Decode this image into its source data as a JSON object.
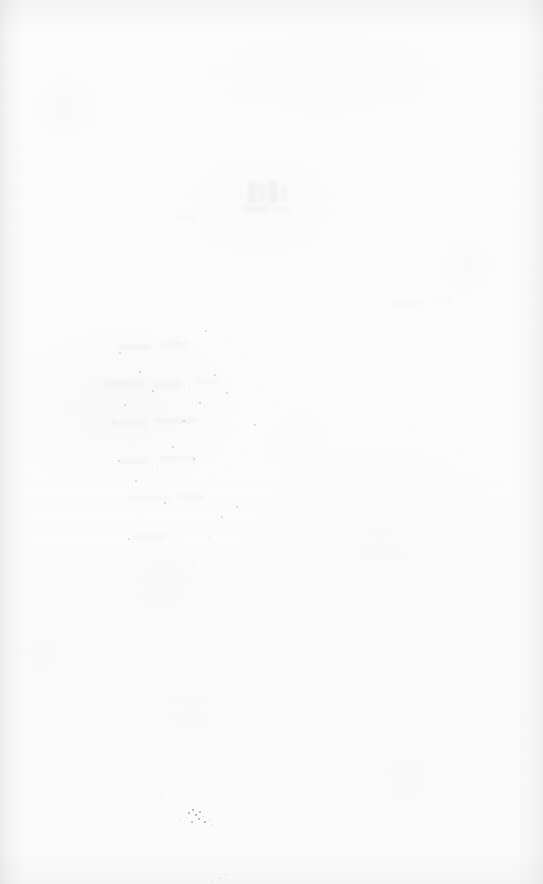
{
  "document": {
    "kind": "scanned-page",
    "content_type": "blank",
    "page_label": "",
    "visible_text": "",
    "width": 543,
    "height": 884
  },
  "appearance": {
    "paper_color": "#fcfcfc",
    "paper_color_light": "#fdfdfd",
    "paper_color_dark": "#fbfbfb",
    "speck_color": "#9a9ca2",
    "speck_color_dark": "#6f7177",
    "edge_shadow_color": "#787c84",
    "ghost_color": "#c9cbd0"
  },
  "regions": {
    "ghost_show_through": {
      "label": "faint show-through near top centre",
      "x": 236,
      "y": 178,
      "width": 62,
      "height": 46
    },
    "speckle_band": {
      "label": "diffuse speckle band, mid page",
      "x": 95,
      "y": 330,
      "width": 195,
      "height": 245
    },
    "dark_speck_cluster": {
      "label": "dark ink fleck cluster near lower left",
      "x": 186,
      "y": 808,
      "width": 28,
      "height": 20
    }
  },
  "ghost_marks": [
    {
      "x": 248,
      "y": 181,
      "w": 9,
      "h": 22,
      "o": 0.16
    },
    {
      "x": 259,
      "y": 184,
      "w": 7,
      "h": 19,
      "o": 0.13
    },
    {
      "x": 268,
      "y": 180,
      "w": 10,
      "h": 23,
      "o": 0.15
    },
    {
      "x": 281,
      "y": 186,
      "w": 6,
      "h": 17,
      "o": 0.11
    },
    {
      "x": 243,
      "y": 205,
      "w": 26,
      "h": 7,
      "o": 0.1
    },
    {
      "x": 272,
      "y": 206,
      "w": 18,
      "h": 6,
      "o": 0.09
    },
    {
      "x": 118,
      "y": 344,
      "w": 34,
      "h": 6,
      "o": 0.1
    },
    {
      "x": 160,
      "y": 341,
      "w": 28,
      "h": 6,
      "o": 0.09
    },
    {
      "x": 104,
      "y": 380,
      "w": 40,
      "h": 7,
      "o": 0.1
    },
    {
      "x": 152,
      "y": 382,
      "w": 30,
      "h": 6,
      "o": 0.09
    },
    {
      "x": 196,
      "y": 378,
      "w": 22,
      "h": 6,
      "o": 0.08
    },
    {
      "x": 110,
      "y": 420,
      "w": 36,
      "h": 6,
      "o": 0.09
    },
    {
      "x": 154,
      "y": 418,
      "w": 44,
      "h": 6,
      "o": 0.09
    },
    {
      "x": 120,
      "y": 458,
      "w": 30,
      "h": 6,
      "o": 0.08
    },
    {
      "x": 158,
      "y": 456,
      "w": 38,
      "h": 6,
      "o": 0.08
    },
    {
      "x": 128,
      "y": 496,
      "w": 42,
      "h": 6,
      "o": 0.08
    },
    {
      "x": 178,
      "y": 494,
      "w": 24,
      "h": 6,
      "o": 0.07
    },
    {
      "x": 132,
      "y": 534,
      "w": 34,
      "h": 6,
      "o": 0.07
    },
    {
      "x": 176,
      "y": 215,
      "w": 20,
      "h": 5,
      "o": 0.07
    },
    {
      "x": 392,
      "y": 300,
      "w": 30,
      "h": 6,
      "o": 0.06
    },
    {
      "x": 430,
      "y": 296,
      "w": 24,
      "h": 6,
      "o": 0.05
    }
  ],
  "specks": [
    {
      "x": 148,
      "y": 332,
      "s": 1.4,
      "o": 0.34
    },
    {
      "x": 176,
      "y": 336,
      "s": 1.1,
      "o": 0.28
    },
    {
      "x": 205,
      "y": 330,
      "s": 1.6,
      "o": 0.38
    },
    {
      "x": 231,
      "y": 341,
      "s": 1.2,
      "o": 0.3
    },
    {
      "x": 119,
      "y": 352,
      "s": 1.5,
      "o": 0.36
    },
    {
      "x": 163,
      "y": 358,
      "s": 1.0,
      "o": 0.26
    },
    {
      "x": 196,
      "y": 351,
      "s": 1.3,
      "o": 0.32
    },
    {
      "x": 246,
      "y": 356,
      "s": 1.1,
      "o": 0.27
    },
    {
      "x": 100,
      "y": 366,
      "s": 1.4,
      "o": 0.33
    },
    {
      "x": 139,
      "y": 371,
      "s": 1.7,
      "o": 0.42
    },
    {
      "x": 182,
      "y": 368,
      "s": 1.2,
      "o": 0.3
    },
    {
      "x": 214,
      "y": 374,
      "s": 1.5,
      "o": 0.36
    },
    {
      "x": 255,
      "y": 370,
      "s": 1.0,
      "o": 0.25
    },
    {
      "x": 108,
      "y": 386,
      "s": 1.3,
      "o": 0.31
    },
    {
      "x": 152,
      "y": 390,
      "s": 1.8,
      "o": 0.45
    },
    {
      "x": 189,
      "y": 384,
      "s": 1.1,
      "o": 0.28
    },
    {
      "x": 226,
      "y": 392,
      "s": 1.6,
      "o": 0.38
    },
    {
      "x": 263,
      "y": 388,
      "s": 1.2,
      "o": 0.29
    },
    {
      "x": 124,
      "y": 404,
      "s": 1.5,
      "o": 0.36
    },
    {
      "x": 166,
      "y": 408,
      "s": 1.2,
      "o": 0.3
    },
    {
      "x": 199,
      "y": 402,
      "s": 1.9,
      "o": 0.48
    },
    {
      "x": 238,
      "y": 410,
      "s": 1.3,
      "o": 0.32
    },
    {
      "x": 272,
      "y": 405,
      "s": 1.0,
      "o": 0.24
    },
    {
      "x": 112,
      "y": 422,
      "s": 1.4,
      "o": 0.34
    },
    {
      "x": 145,
      "y": 427,
      "s": 1.1,
      "o": 0.27
    },
    {
      "x": 183,
      "y": 420,
      "s": 1.7,
      "o": 0.42
    },
    {
      "x": 219,
      "y": 430,
      "s": 1.3,
      "o": 0.31
    },
    {
      "x": 254,
      "y": 424,
      "s": 1.5,
      "o": 0.36
    },
    {
      "x": 130,
      "y": 442,
      "s": 1.2,
      "o": 0.29
    },
    {
      "x": 172,
      "y": 446,
      "s": 1.6,
      "o": 0.39
    },
    {
      "x": 206,
      "y": 440,
      "s": 1.1,
      "o": 0.27
    },
    {
      "x": 243,
      "y": 448,
      "s": 1.4,
      "o": 0.34
    },
    {
      "x": 277,
      "y": 443,
      "s": 1.0,
      "o": 0.23
    },
    {
      "x": 118,
      "y": 460,
      "s": 1.5,
      "o": 0.37
    },
    {
      "x": 157,
      "y": 465,
      "s": 1.2,
      "o": 0.29
    },
    {
      "x": 193,
      "y": 458,
      "s": 1.8,
      "o": 0.44
    },
    {
      "x": 230,
      "y": 468,
      "s": 1.3,
      "o": 0.31
    },
    {
      "x": 266,
      "y": 462,
      "s": 1.1,
      "o": 0.26
    },
    {
      "x": 135,
      "y": 480,
      "s": 1.6,
      "o": 0.39
    },
    {
      "x": 178,
      "y": 484,
      "s": 1.2,
      "o": 0.3
    },
    {
      "x": 212,
      "y": 478,
      "s": 1.4,
      "o": 0.34
    },
    {
      "x": 249,
      "y": 486,
      "s": 1.0,
      "o": 0.24
    },
    {
      "x": 122,
      "y": 498,
      "s": 1.3,
      "o": 0.32
    },
    {
      "x": 164,
      "y": 502,
      "s": 1.7,
      "o": 0.41
    },
    {
      "x": 201,
      "y": 496,
      "s": 1.1,
      "o": 0.27
    },
    {
      "x": 236,
      "y": 506,
      "s": 1.5,
      "o": 0.36
    },
    {
      "x": 271,
      "y": 500,
      "s": 1.2,
      "o": 0.28
    },
    {
      "x": 142,
      "y": 518,
      "s": 1.4,
      "o": 0.34
    },
    {
      "x": 185,
      "y": 522,
      "s": 1.0,
      "o": 0.25
    },
    {
      "x": 221,
      "y": 516,
      "s": 1.6,
      "o": 0.38
    },
    {
      "x": 257,
      "y": 524,
      "s": 1.2,
      "o": 0.29
    },
    {
      "x": 128,
      "y": 538,
      "s": 1.5,
      "o": 0.36
    },
    {
      "x": 170,
      "y": 542,
      "s": 1.1,
      "o": 0.27
    },
    {
      "x": 208,
      "y": 536,
      "s": 1.3,
      "o": 0.32
    },
    {
      "x": 245,
      "y": 546,
      "s": 1.0,
      "o": 0.24
    },
    {
      "x": 150,
      "y": 558,
      "s": 1.4,
      "o": 0.33
    },
    {
      "x": 192,
      "y": 562,
      "s": 1.1,
      "o": 0.26
    },
    {
      "x": 228,
      "y": 556,
      "s": 1.2,
      "o": 0.29
    },
    {
      "x": 264,
      "y": 566,
      "s": 0.9,
      "o": 0.22
    },
    {
      "x": 138,
      "y": 578,
      "s": 1.0,
      "o": 0.24
    },
    {
      "x": 182,
      "y": 584,
      "s": 1.2,
      "o": 0.28
    },
    {
      "x": 220,
      "y": 576,
      "s": 0.9,
      "o": 0.21
    },
    {
      "x": 310,
      "y": 352,
      "s": 1.1,
      "o": 0.22
    },
    {
      "x": 352,
      "y": 368,
      "s": 0.9,
      "o": 0.19
    },
    {
      "x": 398,
      "y": 344,
      "s": 1.2,
      "o": 0.24
    },
    {
      "x": 438,
      "y": 372,
      "s": 1.0,
      "o": 0.2
    },
    {
      "x": 476,
      "y": 356,
      "s": 0.9,
      "o": 0.18
    },
    {
      "x": 324,
      "y": 430,
      "s": 1.1,
      "o": 0.21
    },
    {
      "x": 368,
      "y": 452,
      "s": 0.9,
      "o": 0.18
    },
    {
      "x": 412,
      "y": 424,
      "s": 1.0,
      "o": 0.2
    },
    {
      "x": 458,
      "y": 448,
      "s": 1.2,
      "o": 0.23
    },
    {
      "x": 300,
      "y": 498,
      "s": 0.9,
      "o": 0.18
    },
    {
      "x": 346,
      "y": 520,
      "s": 1.1,
      "o": 0.21
    },
    {
      "x": 390,
      "y": 492,
      "s": 0.9,
      "o": 0.17
    },
    {
      "x": 434,
      "y": 516,
      "s": 1.0,
      "o": 0.19
    },
    {
      "x": 470,
      "y": 540,
      "s": 0.9,
      "o": 0.17
    },
    {
      "x": 96,
      "y": 202,
      "s": 1.0,
      "o": 0.2
    },
    {
      "x": 138,
      "y": 168,
      "s": 0.9,
      "o": 0.18
    },
    {
      "x": 262,
      "y": 140,
      "s": 1.1,
      "o": 0.22
    },
    {
      "x": 318,
      "y": 186,
      "s": 0.9,
      "o": 0.17
    },
    {
      "x": 384,
      "y": 128,
      "s": 1.0,
      "o": 0.19
    },
    {
      "x": 448,
      "y": 196,
      "s": 0.9,
      "o": 0.17
    },
    {
      "x": 480,
      "y": 150,
      "s": 1.0,
      "o": 0.19
    },
    {
      "x": 72,
      "y": 262,
      "s": 0.9,
      "o": 0.18
    },
    {
      "x": 168,
      "y": 242,
      "s": 1.0,
      "o": 0.2
    },
    {
      "x": 224,
      "y": 286,
      "s": 0.9,
      "o": 0.17
    },
    {
      "x": 356,
      "y": 252,
      "s": 1.0,
      "o": 0.19
    },
    {
      "x": 420,
      "y": 278,
      "s": 0.9,
      "o": 0.17
    },
    {
      "x": 64,
      "y": 612,
      "s": 1.0,
      "o": 0.2
    },
    {
      "x": 152,
      "y": 640,
      "s": 0.9,
      "o": 0.18
    },
    {
      "x": 248,
      "y": 628,
      "s": 1.1,
      "o": 0.22
    },
    {
      "x": 340,
      "y": 664,
      "s": 0.9,
      "o": 0.17
    },
    {
      "x": 432,
      "y": 636,
      "s": 1.0,
      "o": 0.19
    },
    {
      "x": 92,
      "y": 700,
      "s": 1.0,
      "o": 0.2
    },
    {
      "x": 196,
      "y": 726,
      "s": 0.9,
      "o": 0.18
    },
    {
      "x": 292,
      "y": 708,
      "s": 1.1,
      "o": 0.21
    },
    {
      "x": 386,
      "y": 742,
      "s": 0.9,
      "o": 0.17
    },
    {
      "x": 466,
      "y": 714,
      "s": 1.0,
      "o": 0.19
    },
    {
      "x": 108,
      "y": 786,
      "s": 1.2,
      "o": 0.26
    },
    {
      "x": 124,
      "y": 800,
      "s": 1.3,
      "o": 0.3
    },
    {
      "x": 146,
      "y": 812,
      "s": 1.1,
      "o": 0.25
    },
    {
      "x": 160,
      "y": 794,
      "s": 1.0,
      "o": 0.22
    },
    {
      "x": 172,
      "y": 822,
      "s": 1.2,
      "o": 0.27
    },
    {
      "x": 218,
      "y": 818,
      "s": 1.3,
      "o": 0.31
    },
    {
      "x": 234,
      "y": 828,
      "s": 1.0,
      "o": 0.23
    },
    {
      "x": 256,
      "y": 806,
      "s": 1.1,
      "o": 0.24
    },
    {
      "x": 118,
      "y": 836,
      "s": 1.0,
      "o": 0.22
    },
    {
      "x": 182,
      "y": 846,
      "s": 1.1,
      "o": 0.24
    },
    {
      "x": 248,
      "y": 852,
      "s": 0.9,
      "o": 0.2
    },
    {
      "x": 306,
      "y": 836,
      "s": 1.0,
      "o": 0.21
    },
    {
      "x": 352,
      "y": 858,
      "s": 0.9,
      "o": 0.19
    },
    {
      "x": 404,
      "y": 844,
      "s": 1.0,
      "o": 0.2
    },
    {
      "x": 460,
      "y": 862,
      "s": 0.9,
      "o": 0.18
    },
    {
      "x": 88,
      "y": 856,
      "s": 1.0,
      "o": 0.21
    },
    {
      "x": 196,
      "y": 866,
      "s": 0.9,
      "o": 0.19
    }
  ],
  "dark_specks": [
    {
      "x": 188,
      "y": 812,
      "s": 2.0,
      "o": 0.62
    },
    {
      "x": 192,
      "y": 809,
      "s": 1.6,
      "o": 0.55
    },
    {
      "x": 195,
      "y": 814,
      "s": 2.3,
      "o": 0.68
    },
    {
      "x": 199,
      "y": 811,
      "s": 1.5,
      "o": 0.5
    },
    {
      "x": 198,
      "y": 818,
      "s": 1.9,
      "o": 0.58
    },
    {
      "x": 203,
      "y": 816,
      "s": 1.4,
      "o": 0.47
    },
    {
      "x": 204,
      "y": 821,
      "s": 1.7,
      "o": 0.54
    },
    {
      "x": 209,
      "y": 819,
      "s": 1.3,
      "o": 0.44
    },
    {
      "x": 186,
      "y": 817,
      "s": 1.2,
      "o": 0.4
    },
    {
      "x": 191,
      "y": 821,
      "s": 1.5,
      "o": 0.48
    },
    {
      "x": 212,
      "y": 824,
      "s": 1.1,
      "o": 0.36
    },
    {
      "x": 180,
      "y": 820,
      "s": 1.0,
      "o": 0.33
    },
    {
      "x": 219,
      "y": 878,
      "s": 1.4,
      "o": 0.42
    },
    {
      "x": 225,
      "y": 874,
      "s": 1.1,
      "o": 0.34
    },
    {
      "x": 211,
      "y": 881,
      "s": 1.0,
      "o": 0.3
    }
  ]
}
